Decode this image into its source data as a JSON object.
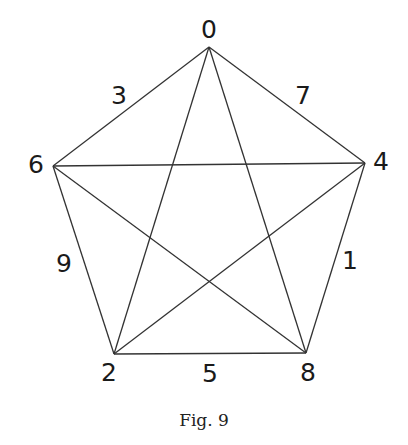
{
  "figure": {
    "caption": "Fig. 9",
    "type": "complete graph K5 (pentagon with pentagram)",
    "line_color": "#333333",
    "text_color": "#1a1a1a"
  },
  "vertices": [
    {
      "id": "v0",
      "label": "0",
      "x": 209,
      "y": 47,
      "lx": 209,
      "ly": 31
    },
    {
      "id": "v4",
      "label": "4",
      "x": 365,
      "y": 163,
      "lx": 381,
      "ly": 163
    },
    {
      "id": "v8",
      "label": "8",
      "x": 306,
      "y": 353,
      "lx": 308,
      "ly": 374
    },
    {
      "id": "v2",
      "label": "2",
      "x": 114,
      "y": 354,
      "lx": 109,
      "ly": 374
    },
    {
      "id": "v6",
      "label": "6",
      "x": 53,
      "y": 166,
      "lx": 36,
      "ly": 166
    }
  ],
  "edges": [
    {
      "from": 0,
      "to": 1,
      "label": "7",
      "lx": 303,
      "ly": 97
    },
    {
      "from": 1,
      "to": 2,
      "label": "1",
      "lx": 350,
      "ly": 262
    },
    {
      "from": 2,
      "to": 3,
      "label": "5",
      "lx": 210,
      "ly": 375
    },
    {
      "from": 3,
      "to": 4,
      "label": "9",
      "lx": 64,
      "ly": 265
    },
    {
      "from": 4,
      "to": 0,
      "label": "3",
      "lx": 119,
      "ly": 97
    },
    {
      "from": 0,
      "to": 2,
      "label": ""
    },
    {
      "from": 0,
      "to": 3,
      "label": ""
    },
    {
      "from": 1,
      "to": 3,
      "label": ""
    },
    {
      "from": 1,
      "to": 4,
      "label": ""
    },
    {
      "from": 2,
      "to": 4,
      "label": ""
    }
  ]
}
